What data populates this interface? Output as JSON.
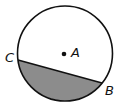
{
  "diagram": {
    "type": "circle-with-chord-segment",
    "center_label": "A",
    "points": [
      {
        "label": "C",
        "position": "left end of chord"
      },
      {
        "label": "B",
        "position": "right end of chord"
      }
    ],
    "shaded_region": "minor segment below chord CB",
    "colors": {
      "stroke": "#111111",
      "shade": "#8c8c8c",
      "background": "#ffffff"
    }
  }
}
